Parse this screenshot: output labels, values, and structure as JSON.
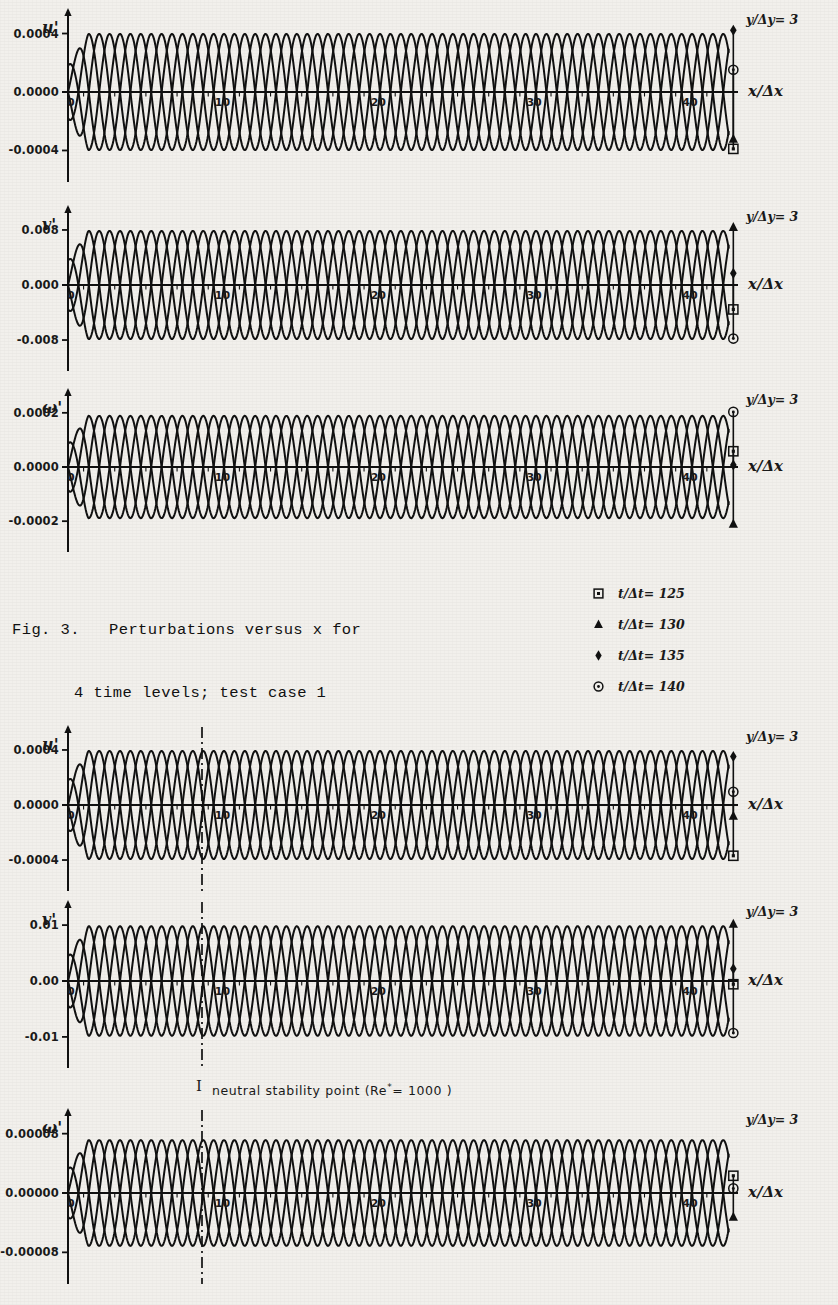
{
  "figure": {
    "caption_line1": "Fig. 3.   Perturbations versus x for",
    "caption_line2": "4 time levels; test case 1"
  },
  "legend": {
    "entries": [
      {
        "marker": "square-marker",
        "label": "t/Δt= 125"
      },
      {
        "marker": "triangle-marker",
        "label": "t/Δt= 130"
      },
      {
        "marker": "diamond-marker",
        "label": "t/Δt= 135"
      },
      {
        "marker": "circle-dot-marker",
        "label": "t/Δt= 140"
      }
    ]
  },
  "annotations": {
    "neutral_stability_bar": "I",
    "neutral_stability_text_pre": "neutral  stability  point  (Re",
    "neutral_stability_sup": "*",
    "neutral_stability_text_post": "= 1000 )"
  },
  "axis_common": {
    "xlabel": "x/Δx",
    "xticks": [
      "0",
      "10",
      "20",
      "30",
      "40"
    ],
    "ydepth_label": "y/Δy= 3",
    "xmin": 0,
    "xmax": 43
  },
  "chart_data": {
    "type": "line",
    "title": "Perturbations versus x for 4 time levels; test case 1",
    "xlabel": "x/Δx",
    "grid": false,
    "legend_position": "right-of-caption",
    "series_names": [
      "t/Δt= 125",
      "t/Δt= 130",
      "t/Δt= 135",
      "t/Δt= 140"
    ],
    "series_phase_shift_deg": [
      0,
      90,
      180,
      270
    ],
    "wavelength_in_x_units": 2.67,
    "panels": [
      {
        "group": "test case 1",
        "variable": "u'",
        "yticks": [
          "0.0004",
          "0.0000",
          "-0.0004"
        ],
        "ylim": [
          -0.00055,
          0.00055
        ],
        "amplitude": 0.00047,
        "envelope": "constant",
        "neutral_point": null,
        "end_markers": [
          {
            "series": "t/Δt= 140",
            "marker": "circle-dot-marker",
            "y": 0.00018
          },
          {
            "series": "t/Δt= 130",
            "marker": "triangle-marker",
            "y": -0.00038
          },
          {
            "series": "t/Δt= 125",
            "marker": "square-marker",
            "y": -0.00046
          },
          {
            "series": "t/Δt= 135",
            "marker": "diamond-marker",
            "y": 0.0005
          }
        ]
      },
      {
        "group": "test case 1",
        "variable": "v'",
        "yticks": [
          "0.008",
          "0.000",
          "-0.008"
        ],
        "ylim": [
          -0.011,
          0.011
        ],
        "amplitude": 0.0093,
        "envelope": "constant",
        "neutral_point": null,
        "end_markers": [
          {
            "series": "t/Δt= 135",
            "marker": "diamond-marker",
            "y": 0.002
          },
          {
            "series": "t/Δt= 125",
            "marker": "square-marker",
            "y": -0.0042
          },
          {
            "series": "t/Δt= 140",
            "marker": "circle-dot-marker",
            "y": -0.0092
          },
          {
            "series": "t/Δt= 130",
            "marker": "triangle-marker",
            "y": 0.0099
          }
        ]
      },
      {
        "group": "test case 1",
        "variable": "ω'",
        "yticks": [
          "0.0002",
          "0.0000",
          "-0.0002"
        ],
        "ylim": [
          -0.00032,
          0.00032
        ],
        "amplitude": 0.00026,
        "envelope": "constant",
        "neutral_point": null,
        "end_markers": [
          {
            "series": "t/Δt= 140",
            "marker": "circle-dot-marker",
            "y": 0.00028
          },
          {
            "series": "t/Δt= 125",
            "marker": "square-marker",
            "y": 8e-05
          },
          {
            "series": "t/Δt= 135",
            "marker": "diamond-marker",
            "y": 1e-05
          },
          {
            "series": "t/Δt= 130",
            "marker": "triangle-marker",
            "y": -0.00029
          }
        ]
      },
      {
        "group": "test case 2",
        "variable": "u'",
        "yticks": [
          "0.0004",
          "0.0000",
          "-0.0004"
        ],
        "ylim": [
          -0.00058,
          0.00058
        ],
        "amplitude": 0.00049,
        "envelope": "constant",
        "neutral_point": 8.6,
        "end_markers": [
          {
            "series": "t/Δt= 135",
            "marker": "diamond-marker",
            "y": 0.00044
          },
          {
            "series": "t/Δt= 140",
            "marker": "circle-dot-marker",
            "y": 0.00012
          },
          {
            "series": "t/Δt= 130",
            "marker": "triangle-marker",
            "y": -0.0001
          },
          {
            "series": "t/Δt= 125",
            "marker": "square-marker",
            "y": -0.00046
          }
        ]
      },
      {
        "group": "test case 2",
        "variable": "v'",
        "yticks": [
          "0.01",
          "0.00",
          "-0.01"
        ],
        "ylim": [
          -0.016,
          0.016
        ],
        "amplitude": 0.0135,
        "envelope": "constant",
        "neutral_point": 8.6,
        "end_markers": [
          {
            "series": "t/Δt= 130",
            "marker": "triangle-marker",
            "y": 0.014
          },
          {
            "series": "t/Δt= 135",
            "marker": "diamond-marker",
            "y": 0.003
          },
          {
            "series": "t/Δt= 125",
            "marker": "square-marker",
            "y": -0.0008
          },
          {
            "series": "t/Δt= 140",
            "marker": "circle-dot-marker",
            "y": -0.0128
          }
        ]
      },
      {
        "group": "test case 2",
        "variable": "ω'",
        "yticks": [
          "0.00008",
          "0.00000",
          "-0.00008"
        ],
        "ylim": [
          -0.00012,
          0.00012
        ],
        "amplitude": 9.2e-05,
        "envelope": "constant",
        "neutral_point": 8.6,
        "end_markers": [
          {
            "series": "t/Δt= 125",
            "marker": "square-marker",
            "y": 3e-05
          },
          {
            "series": "t/Δt= 140",
            "marker": "circle-dot-marker",
            "y": 8e-06
          },
          {
            "series": "t/Δt= 130",
            "marker": "triangle-marker",
            "y": -4.2e-05
          }
        ]
      }
    ]
  },
  "panel_layout": [
    {
      "top": 8,
      "height": 178
    },
    {
      "top": 205,
      "height": 170
    },
    {
      "top": 388,
      "height": 168
    },
    {
      "top": 725,
      "height": 170
    },
    {
      "top": 900,
      "height": 172
    },
    {
      "top": 1108,
      "height": 180
    }
  ]
}
